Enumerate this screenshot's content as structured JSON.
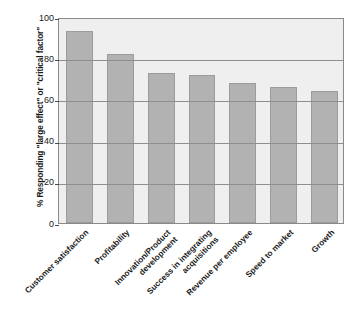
{
  "chart_data": {
    "type": "bar",
    "title": "",
    "subtitle": "",
    "xlabel": "",
    "ylabel": "% Responding \"large effect\" or \"critical factor\"",
    "ylim": [
      0,
      100
    ],
    "ytick_values": [
      100,
      80,
      60,
      40,
      20,
      0
    ],
    "ytick_labels": [
      "100",
      "80",
      "60",
      "40",
      "20",
      "0"
    ],
    "grid": "horizontal",
    "legend": "none",
    "bar_color": "#b2b2b2",
    "plot_background": "#efefef",
    "categories": [
      "Customer satisfaction",
      "Profitability",
      "Innovation/Product development",
      "Success in integrating acquisitions",
      "Revenue per employee",
      "Speed to market",
      "Growth"
    ],
    "category_lines": [
      [
        "Customer satisfaction"
      ],
      [
        "Profitability"
      ],
      [
        "Innovation/Product",
        "development"
      ],
      [
        "Success in integrating",
        "acquisitions"
      ],
      [
        "Revenue per employee"
      ],
      [
        "Speed to market"
      ],
      [
        "Growth"
      ]
    ],
    "values": [
      93,
      82,
      73,
      72,
      68,
      66,
      64
    ]
  }
}
